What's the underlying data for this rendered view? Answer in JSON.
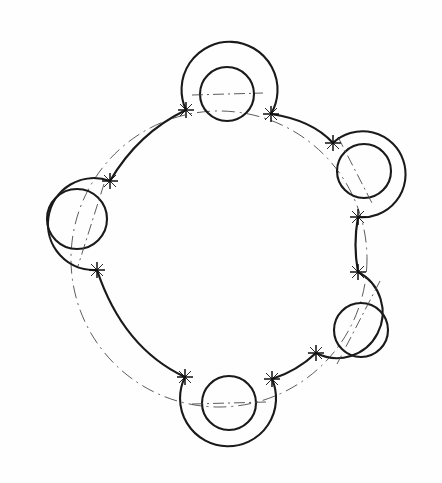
{
  "document": {
    "title": "Engineering Drawing Viewport",
    "view_label": "",
    "background_color": "#fefefe",
    "line_color": "#1a1a1a",
    "centerline_color": "#4a4a4a"
  },
  "drawing": {
    "name": "five-lobe-ring-pattern",
    "description": "Circular ring pattern with five cylindrical bosses, each containing a through hole, joined by tangent fillet arcs around a pitch circle",
    "canvas": {
      "width": 442,
      "height": 483
    },
    "pattern_center": {
      "x": 219,
      "y": 259
    },
    "pitch_circle": {
      "cx": 219,
      "cy": 259,
      "r": 148,
      "linetype": "dash-dot"
    },
    "lobes": [
      {
        "id": "lobe-top",
        "position_label": "top",
        "boss": {
          "cx": 227,
          "cy": 88,
          "r": 48
        },
        "hole": {
          "cx": 227,
          "cy": 94,
          "r": 27
        },
        "opening_angle_deg": 90,
        "centerline": "horizontal"
      },
      {
        "id": "lobe-upper-right",
        "position_label": "upper-right",
        "boss": {
          "cx": 373,
          "cy": 173,
          "r": 43
        },
        "hole": {
          "cx": 364,
          "cy": 171,
          "r": 27
        },
        "opening_angle_deg": 200,
        "centerline": "diagonal"
      },
      {
        "id": "lobe-lower-right",
        "position_label": "lower-right",
        "boss": {
          "cx": 369,
          "cy": 331,
          "r": 45
        },
        "hole": {
          "cx": 361,
          "cy": 330,
          "r": 27
        },
        "opening_angle_deg": 160,
        "centerline": "diagonal"
      },
      {
        "id": "lobe-bottom",
        "position_label": "bottom",
        "boss": {
          "cx": 226,
          "cy": 412,
          "r": 48
        },
        "hole": {
          "cx": 229,
          "cy": 403,
          "r": 27
        },
        "opening_angle_deg": 270,
        "centerline": "horizontal"
      },
      {
        "id": "lobe-left",
        "position_label": "left",
        "boss": {
          "cx": 71,
          "cy": 213,
          "r": 46
        },
        "hole": {
          "cx": 77,
          "cy": 219,
          "r": 30
        },
        "opening_angle_deg": 0,
        "centerline": "diagonal"
      }
    ],
    "connector_arcs": [
      {
        "id": "arc-left-top",
        "from": "lobe-left",
        "to": "lobe-top",
        "bulge": "inward"
      },
      {
        "id": "arc-top-upper-right",
        "from": "lobe-top",
        "to": "lobe-upper-right",
        "bulge": "inward"
      },
      {
        "id": "arc-right-short",
        "from": "lobe-upper-right",
        "to": "lobe-lower-right",
        "bulge": "inward"
      },
      {
        "id": "arc-lower-right-bottom",
        "from": "lobe-lower-right",
        "to": "lobe-bottom",
        "bulge": "inward"
      },
      {
        "id": "arc-bottom-left",
        "from": "lobe-bottom",
        "to": "lobe-left",
        "bulge": "inward"
      }
    ],
    "node_markers": [
      {
        "id": "node-1",
        "x": 186,
        "y": 110
      },
      {
        "id": "node-2",
        "x": 271,
        "y": 114
      },
      {
        "id": "node-3",
        "x": 333,
        "y": 143
      },
      {
        "id": "node-4",
        "x": 358,
        "y": 217
      },
      {
        "id": "node-5",
        "x": 358,
        "y": 272
      },
      {
        "id": "node-6",
        "x": 316,
        "y": 353
      },
      {
        "id": "node-7",
        "x": 272,
        "y": 379
      },
      {
        "id": "node-8",
        "x": 185,
        "y": 377
      },
      {
        "id": "node-9",
        "x": 97,
        "y": 270
      },
      {
        "id": "node-10",
        "x": 110,
        "y": 181
      }
    ],
    "stats": {
      "lobe_count": 5,
      "hole_count": 5,
      "node_count": 10,
      "connector_count": 5
    }
  }
}
